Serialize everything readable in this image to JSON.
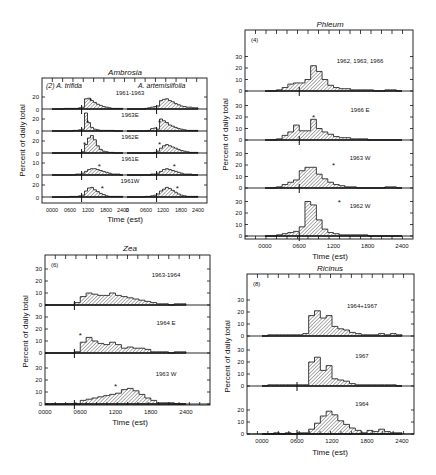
{
  "chart_data": [
    {
      "id": "ambrosia",
      "type": "bar",
      "title": "Ambrosia",
      "panel_label": "(2)",
      "subtitles": [
        "A. trifida",
        "A. artemisiifolia"
      ],
      "xlabel": "Time (est)",
      "ylabel": "Percent of daily total",
      "x_tick_labels": [
        "0000",
        "0600",
        "1200",
        "1800",
        "2400",
        "0",
        "0600",
        "1200",
        "1800",
        "2400"
      ],
      "y_tick_labels_per_row": [
        [
          "0",
          "20"
        ],
        [
          "0",
          "20"
        ],
        [
          "0",
          "20"
        ],
        [
          "0",
          "10"
        ],
        [
          "0",
          "20"
        ]
      ],
      "bin_hours": 1,
      "rows": [
        {
          "label": "1961-1963",
          "ymax": 30,
          "left": [
            0,
            0,
            0,
            0,
            1,
            1,
            1,
            1,
            1,
            2,
            3,
            17,
            18,
            14,
            11,
            8,
            6,
            4,
            3,
            2,
            1,
            1,
            1,
            1
          ],
          "right": [
            0,
            0,
            0,
            0,
            0,
            0,
            1,
            2,
            3,
            4,
            5,
            14,
            16,
            17,
            14,
            12,
            9,
            7,
            5,
            4,
            3,
            3,
            2,
            2
          ],
          "left_marker_hour": 10,
          "right_marker_hour": 10,
          "left_star_hour": 13,
          "right_star_hour": null
        },
        {
          "label": "1963E",
          "ymax": 30,
          "left": [
            0,
            0,
            0,
            0,
            0,
            0,
            0,
            1,
            1,
            2,
            3,
            30,
            14,
            6,
            3,
            2,
            1,
            1,
            1,
            1,
            1,
            0,
            0,
            0
          ],
          "right": [
            0,
            0,
            0,
            0,
            0,
            0,
            0,
            1,
            4,
            5,
            3,
            20,
            17,
            14,
            10,
            8,
            6,
            4,
            3,
            2,
            1,
            1,
            1,
            1
          ],
          "left_marker_hour": 10,
          "right_marker_hour": 10,
          "left_star_hour": 12,
          "right_star_hour": 11
        },
        {
          "label": "1962E",
          "ymax": 30,
          "left": [
            0,
            0,
            0,
            0,
            0,
            0,
            0,
            0,
            0,
            0,
            2,
            14,
            25,
            29,
            22,
            12,
            6,
            3,
            2,
            1,
            1,
            0,
            0,
            0
          ],
          "right": [
            0,
            0,
            0,
            0,
            0,
            0,
            0,
            0,
            0,
            1,
            3,
            8,
            12,
            14,
            12,
            10,
            8,
            6,
            4,
            3,
            2,
            1,
            1,
            1
          ],
          "left_marker_hour": 10,
          "right_marker_hour": 10,
          "left_star_hour": 11,
          "right_star_hour": 11
        },
        {
          "label": "1961E",
          "ymax": 15,
          "left": [
            0,
            0,
            0,
            0,
            0,
            0,
            0,
            0,
            1,
            1,
            2,
            4,
            6,
            7,
            7,
            6,
            5,
            4,
            3,
            2,
            1,
            1,
            1,
            0
          ],
          "right": [
            0,
            0,
            0,
            0,
            0,
            0,
            0,
            0,
            1,
            1,
            2,
            4,
            6,
            7,
            6,
            5,
            4,
            3,
            2,
            1,
            1,
            1,
            0,
            0
          ],
          "left_marker_hour": 10,
          "right_marker_hour": 10,
          "left_star_hour": 16,
          "right_star_hour": 16
        },
        {
          "label": "1961W",
          "ymax": 30,
          "left": [
            0,
            0,
            0,
            0,
            0,
            0,
            1,
            1,
            1,
            2,
            3,
            10,
            15,
            16,
            12,
            9,
            6,
            4,
            2,
            1,
            1,
            1,
            1,
            1
          ],
          "right": [
            0,
            0,
            0,
            0,
            0,
            0,
            1,
            1,
            2,
            3,
            5,
            10,
            13,
            16,
            14,
            11,
            8,
            5,
            3,
            2,
            1,
            1,
            1,
            1
          ],
          "left_marker_hour": 10,
          "right_marker_hour": 10,
          "left_star_hour": 17,
          "right_star_hour": 17
        }
      ]
    },
    {
      "id": "phleum",
      "type": "bar",
      "title": "Phleum",
      "panel_label": "(4)",
      "xlabel": "Time (est)",
      "ylabel": "Percent of daily total",
      "x_tick_labels": [
        "0000",
        "0600",
        "1200",
        "1800",
        "2400"
      ],
      "y_tick_labels": [
        "0",
        "10",
        "20",
        "30"
      ],
      "rows": [
        {
          "label": "1962, 1963, 1966",
          "ymax": 35,
          "marker_hour": 6,
          "star_hour": null,
          "values": [
            0,
            0,
            1,
            3,
            6,
            7,
            7,
            10,
            22,
            17,
            10,
            5,
            3,
            2,
            2,
            1,
            1,
            1,
            1,
            0,
            0,
            1,
            1,
            0
          ]
        },
        {
          "label": "1966 E",
          "ymax": 35,
          "marker_hour": 6,
          "star_hour": 8.5,
          "values": [
            0,
            0,
            1,
            4,
            7,
            13,
            8,
            8,
            18,
            10,
            7,
            5,
            3,
            2,
            2,
            1,
            1,
            1,
            0,
            0,
            0,
            0,
            0,
            0
          ]
        },
        {
          "label": "1963 W",
          "ymax": 35,
          "marker_hour": 6,
          "star_hour": 12,
          "values": [
            0,
            0,
            1,
            3,
            5,
            7,
            15,
            18,
            18,
            12,
            8,
            5,
            3,
            2,
            1,
            1,
            0,
            0,
            0,
            0,
            0,
            1,
            1,
            0
          ]
        },
        {
          "label": "1962 W",
          "ymax": 35,
          "marker_hour": 6,
          "star_hour": 13,
          "values": [
            0,
            0,
            1,
            2,
            3,
            4,
            8,
            30,
            27,
            14,
            6,
            3,
            2,
            1,
            1,
            1,
            1,
            1,
            0,
            0,
            0,
            0,
            0,
            0
          ]
        }
      ]
    },
    {
      "id": "zea",
      "type": "bar",
      "title": "Zea",
      "panel_label": "(6)",
      "xlabel": "Time (est)",
      "ylabel": "Percent of daily total",
      "x_tick_labels": [
        "0000",
        "0600",
        "1200",
        "1800",
        "2400"
      ],
      "y_tick_labels": [
        "0",
        "10",
        "20",
        "30"
      ],
      "rows": [
        {
          "label": "1963-1964",
          "ymax": 35,
          "marker_hour": 5,
          "star_hour": null,
          "values": [
            0,
            0,
            0,
            0,
            0,
            2,
            7,
            10,
            9,
            8,
            8,
            10,
            8,
            7,
            6,
            5,
            4,
            3,
            2,
            1,
            1,
            0,
            1,
            1
          ]
        },
        {
          "label": "1964  E",
          "ymax": 35,
          "marker_hour": 5,
          "star_hour": 6,
          "values": [
            0,
            0,
            0,
            0,
            0,
            1,
            9,
            13,
            10,
            8,
            7,
            9,
            7,
            4,
            5,
            4,
            4,
            3,
            1,
            1,
            1,
            0,
            1,
            1
          ]
        },
        {
          "label": "1963 W",
          "ymax": 35,
          "marker_hour": 5,
          "star_hour": 12,
          "values": [
            0,
            0,
            0,
            0,
            0,
            0,
            3,
            4,
            5,
            6,
            7,
            8,
            9,
            12,
            13,
            11,
            8,
            5,
            3,
            1,
            1,
            1,
            0,
            0
          ]
        }
      ]
    },
    {
      "id": "ricinus",
      "type": "bar",
      "title": "Ricinus",
      "panel_label": "(8)",
      "xlabel": "Time (est)",
      "ylabel": "Percent of daily total",
      "x_tick_labels": [
        "0000",
        "0600",
        "1200",
        "1800",
        "2400"
      ],
      "y_tick_labels": [
        "0",
        "10",
        "20",
        "30"
      ],
      "rows": [
        {
          "label": "1964+1967",
          "ymax": 35,
          "marker_hour": null,
          "star_hour": null,
          "values": [
            0,
            1,
            1,
            1,
            1,
            1,
            1,
            2,
            17,
            21,
            15,
            17,
            8,
            6,
            5,
            3,
            2,
            1,
            1,
            1,
            2,
            1,
            2,
            1
          ]
        },
        {
          "label": "1967",
          "ymax": 35,
          "marker_hour": 6,
          "star_hour": null,
          "values": [
            0,
            1,
            1,
            1,
            1,
            1,
            1,
            1,
            20,
            24,
            13,
            17,
            6,
            5,
            4,
            2,
            1,
            1,
            1,
            1,
            1,
            1,
            1,
            0
          ]
        },
        {
          "label": "1964",
          "ymax": 28,
          "marker_hour": 6,
          "star_hour": null,
          "values": [
            0,
            0,
            1,
            0,
            1,
            0,
            1,
            1,
            4,
            9,
            15,
            19,
            16,
            11,
            8,
            5,
            3,
            1,
            3,
            2,
            4,
            2,
            1,
            1
          ]
        }
      ]
    }
  ]
}
